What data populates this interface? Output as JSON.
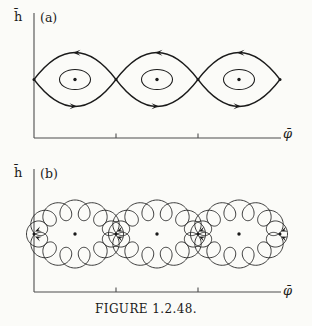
{
  "figure": {
    "caption": "FIGURE 1.2.48.",
    "background": "#fbfbf8",
    "ink_color": "#1a1a1a",
    "axis_color": "#4d4d4d"
  },
  "panels": {
    "a": {
      "tag": "(a)",
      "y_label": "h̄",
      "x_label": "φ̄"
    },
    "b": {
      "tag": "(b)",
      "y_label": "h̄",
      "x_label": "φ̄"
    }
  },
  "diagram": {
    "type": "pendulum-phase-portraits",
    "description_a": "chain of three separatrix eyes with closed orbits around center points; flow leftward on top arcs, rightward on bottom arcs",
    "description_b": "same chain of eyes traced by rapidly oscillating looped trajectories around the center points",
    "saddle_xs": [
      34,
      116,
      198,
      280
    ],
    "center_xs": [
      75,
      157,
      239
    ],
    "axis_x": 34,
    "axis_x_end": 281,
    "tick_xs": [
      116,
      198
    ],
    "panel_a": {
      "axis_top_y": 13,
      "axis_y": 138,
      "midline_y": 79.5,
      "eye_half_height": 27,
      "inner_rx": 15.5,
      "inner_ry": 10,
      "top_flow": "left",
      "bottom_flow": "right"
    },
    "panel_b": {
      "offset_y": 155,
      "axis_top_y": 14,
      "axis_y": 137,
      "midline_y": 79,
      "ellipse_a": 38.5,
      "ellipse_b": 24,
      "loop_amplitude": 10,
      "loops_per_orbit": 13
    }
  }
}
